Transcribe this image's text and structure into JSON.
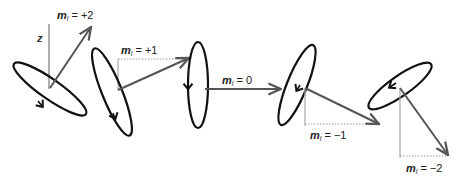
{
  "diagram": {
    "type": "vector-model-orbital-angular-momentum",
    "axis_label": "z",
    "colors": {
      "orbit": "#111111",
      "vector": "#555555",
      "projection": "#888888",
      "text": "#222222"
    },
    "states": [
      {
        "id": "ml-plus-2",
        "symbol": "m",
        "subscript": "l",
        "relation": " = ",
        "value": "+2"
      },
      {
        "id": "ml-plus-1",
        "symbol": "m",
        "subscript": "l",
        "relation": " = ",
        "value": "+1"
      },
      {
        "id": "ml-zero",
        "symbol": "m",
        "subscript": "l",
        "relation": " = ",
        "value": "0"
      },
      {
        "id": "ml-minus-1",
        "symbol": "m",
        "subscript": "l",
        "relation": " = ",
        "value": "−1"
      },
      {
        "id": "ml-minus-2",
        "symbol": "m",
        "subscript": "l",
        "relation": " = ",
        "value": "−2"
      }
    ]
  }
}
